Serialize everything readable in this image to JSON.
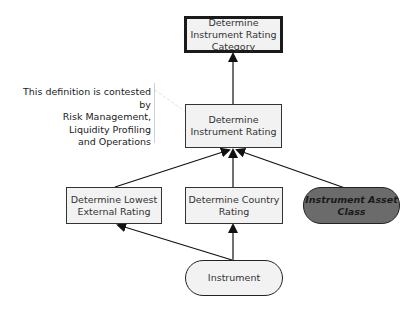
{
  "diagram": {
    "nodes": {
      "rating_category": {
        "label": "Determine Instrument Rating Category",
        "line1": "Determine",
        "line2": "Instrument Rating",
        "line3": "Category",
        "shape": "rectangle-bold"
      },
      "instrument_rating": {
        "label": "Determine Instrument Rating",
        "line1": "Determine",
        "line2": "Instrument Rating",
        "shape": "rectangle"
      },
      "lowest_external": {
        "label": "Determine Lowest External Rating",
        "line1": "Determine Lowest",
        "line2": "External Rating",
        "shape": "rectangle"
      },
      "country_rating": {
        "label": "Determine Country Rating",
        "line1": "Determine Country",
        "line2": "Rating",
        "shape": "rectangle"
      },
      "asset_class": {
        "label": "Instrument Asset Class",
        "line1": "Instrument Asset",
        "line2": "Class",
        "shape": "pill-dark",
        "fill": "#6b6b6b"
      },
      "instrument": {
        "label": "Instrument",
        "shape": "pill-light"
      }
    },
    "annotation": {
      "line1": "This definition is contested by",
      "line2": "Risk Management,",
      "line3": "Liquidity Profiling",
      "line4": "and Operations",
      "target": "instrument_rating"
    },
    "edges": [
      {
        "from": "instrument_rating",
        "to": "rating_category"
      },
      {
        "from": "lowest_external",
        "to": "instrument_rating"
      },
      {
        "from": "country_rating",
        "to": "instrument_rating"
      },
      {
        "from": "asset_class",
        "to": "instrument_rating"
      },
      {
        "from": "instrument",
        "to": "lowest_external"
      },
      {
        "from": "instrument",
        "to": "country_rating"
      }
    ]
  }
}
